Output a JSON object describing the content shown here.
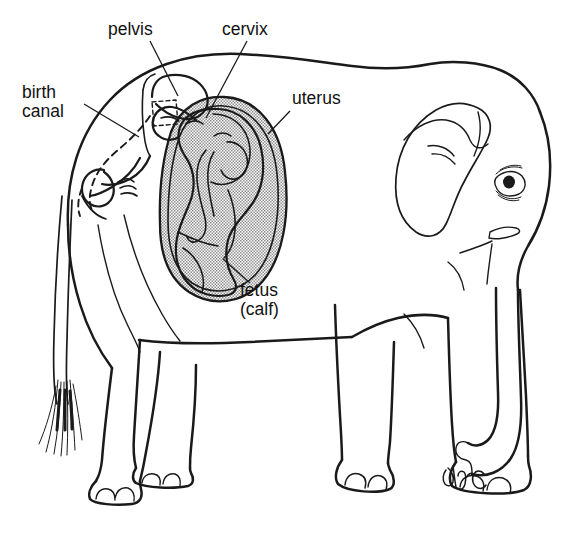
{
  "figure": {
    "background_color": "#ffffff",
    "ink_color": "#1a1a1a",
    "shading_color": "#9c9c9c",
    "view": "lateral side view, facing right"
  },
  "labels": [
    {
      "id": "pelvis",
      "text": "pelvis",
      "x": 108,
      "y": 35,
      "leader": "M 150 41 L 178 96",
      "points_to": "pelvic bone above uterus"
    },
    {
      "id": "cervix",
      "text": "cervix",
      "x": 222,
      "y": 35,
      "leader": "M 247 41 L 206 118",
      "points_to": "cervix at front of uterus"
    },
    {
      "id": "birth-canal-line1",
      "text": "birth",
      "x": 22,
      "y": 98,
      "leader": "M 84 104 L 139 137",
      "points_to": "birth canal passage"
    },
    {
      "id": "birth-canal-line2",
      "text": "canal",
      "x": 22,
      "y": 117,
      "leader": "",
      "points_to": ""
    },
    {
      "id": "uterus",
      "text": "uterus",
      "x": 292,
      "y": 104,
      "leader": "M 290 111 L 268 134",
      "points_to": "uterine wall"
    },
    {
      "id": "fetus-line1",
      "text": "fetus",
      "x": 240,
      "y": 296,
      "leader": "M 250 283 L 223 259",
      "points_to": "curled fetal calf inside uterus"
    },
    {
      "id": "fetus-line2",
      "text": "(calf)",
      "x": 240,
      "y": 315,
      "leader": "",
      "points_to": ""
    }
  ],
  "anatomy_parts": [
    "mother elephant body outline",
    "head",
    "ear",
    "eye",
    "trunk",
    "tusk",
    "front legs",
    "hind legs",
    "feet with toenails",
    "tail with hair tuft",
    "pelvis bone",
    "birth canal",
    "cervix",
    "uterus",
    "fetus (calf)"
  ],
  "signature": {
    "present": true,
    "text": "artist monogram",
    "x": 452,
    "y": 480
  }
}
